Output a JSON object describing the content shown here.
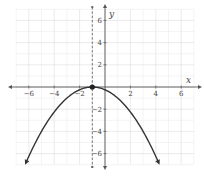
{
  "chart_data": {
    "type": "line",
    "title": "",
    "xlabel": "x",
    "ylabel": "y",
    "xlim": [
      -7,
      7
    ],
    "ylim": [
      -7,
      7
    ],
    "grid": true,
    "x_ticks": [
      -6,
      -4,
      -2,
      2,
      4,
      6
    ],
    "y_ticks": [
      6,
      4,
      2,
      -2,
      -4,
      -6
    ],
    "x_tick_labels": [
      "−6",
      "−4",
      "−2",
      "2",
      "4",
      "6"
    ],
    "y_tick_labels": [
      "6",
      "4",
      "2",
      "−2",
      "−4",
      "−6"
    ],
    "series": [
      {
        "name": "parabola",
        "equation": "y = -1/4 (x + 1)^2",
        "x": [
          -6.2,
          -6,
          -5,
          -4,
          -3,
          -2,
          -1,
          0,
          1,
          2,
          3,
          4,
          4.2
        ],
        "y": [
          -6.76,
          -6.25,
          -4,
          -2.25,
          -1,
          -0.25,
          0,
          -0.25,
          -1,
          -2.25,
          -4,
          -6.25,
          -6.76
        ],
        "color": "#333333",
        "arrows_at_ends": true
      }
    ],
    "annotations": [
      {
        "type": "point",
        "x": -1,
        "y": 0,
        "label": "vertex"
      },
      {
        "type": "dashed_vertical_line",
        "x": -1,
        "label": "axis of symmetry"
      }
    ]
  }
}
